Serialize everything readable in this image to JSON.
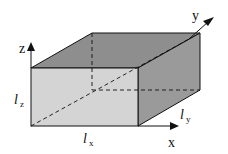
{
  "diagram": {
    "type": "3d-rectangular-box",
    "axes": {
      "x": "x",
      "y": "y",
      "z": "z"
    },
    "dimensions": {
      "lx": {
        "symbol": "l",
        "subscript": "x"
      },
      "ly": {
        "symbol": "l",
        "subscript": "y"
      },
      "lz": {
        "symbol": "l",
        "subscript": "z"
      }
    },
    "colors": {
      "front_face": "#d4d4d4",
      "top_face": "#8e8e8e",
      "side_face": "#9a9a9a",
      "edges": "#111111"
    }
  }
}
